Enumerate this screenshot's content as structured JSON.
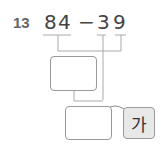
{
  "problem": {
    "number": "13",
    "digits": [
      "8",
      "4",
      "−",
      "3",
      "9"
    ],
    "answer_box_1": "",
    "answer_box_2": "",
    "label": "가"
  }
}
